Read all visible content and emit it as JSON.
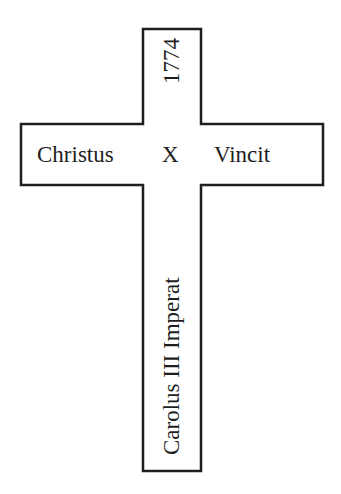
{
  "cross": {
    "stroke_color": "#1e1e1e",
    "fill_color": "#ffffff",
    "horizontal_arm": {
      "left_text": "Christus",
      "center_text": "X",
      "right_text": "Vincit"
    },
    "vertical_arm": {
      "top_text": "1774",
      "bottom_text": "Carolus III Imperat"
    }
  }
}
